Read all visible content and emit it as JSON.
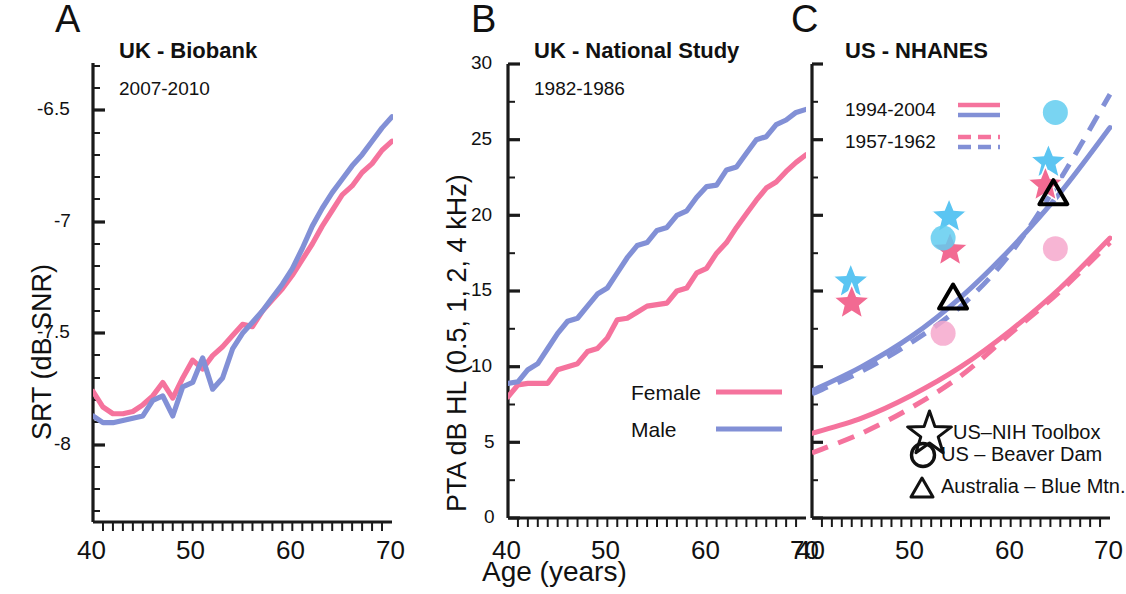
{
  "figure": {
    "xlabel": "Age (years)",
    "x_ticks": [
      "40",
      "50",
      "60",
      "70"
    ],
    "colors": {
      "female_pink": "#F5739D",
      "male_blue": "#8290D6",
      "marker_blue": "#5BC5F2",
      "marker_pink": "#F26A92",
      "circle_cyan": "#62CDF0",
      "circle_pink": "#F6A8CC",
      "axis_black": "#1a1a1a"
    }
  },
  "panelA": {
    "letter": "A",
    "title": "UK - Biobank",
    "subtitle": "2007-2010",
    "ylabel": "SRT (dB SNR)",
    "y_ticks": [
      "-6.5",
      "-7",
      "-7.5",
      "-8"
    ],
    "x_ticks": [
      "40",
      "50",
      "60",
      "70"
    ]
  },
  "panelB": {
    "letter": "B",
    "title": "UK - National Study",
    "subtitle": "1982-1986",
    "ylabel": "PTA dB HL (0.5, 1, 2, 4 kHz)",
    "y_ticks": [
      "30",
      "25",
      "20",
      "15",
      "10",
      "5",
      "0"
    ],
    "x_ticks": [
      "40",
      "50",
      "60",
      "70"
    ],
    "legend": [
      {
        "label": "Female",
        "style": "solid",
        "color": "#F5739D"
      },
      {
        "label": "Male",
        "style": "solid",
        "color": "#8290D6"
      }
    ]
  },
  "panelC": {
    "letter": "C",
    "title": "US - NHANES",
    "x_ticks": [
      "40",
      "50",
      "60",
      "70"
    ],
    "period_legend": [
      {
        "label": "1994-2004",
        "style": "solid"
      },
      {
        "label": "1957-1962",
        "style": "dashed"
      }
    ],
    "marker_legend": [
      {
        "symbol": "star",
        "label": "US–NIH Toolbox"
      },
      {
        "symbol": "circle",
        "label": "US – Beaver Dam"
      },
      {
        "symbol": "triangle",
        "label": "Australia – Blue Mtn."
      }
    ]
  },
  "chart_data": [
    {
      "type": "line",
      "panel": "A",
      "title": "UK - Biobank",
      "subtitle": "2007-2010",
      "xlabel": "Age (years)",
      "ylabel": "SRT (dB SNR)",
      "xlim": [
        40,
        70
      ],
      "ylim": [
        -8.2,
        -6.3
      ],
      "yticks": [
        -6.5,
        -7,
        -7.5,
        -8
      ],
      "xticks": [
        40,
        50,
        60,
        70
      ],
      "grid": false,
      "legend": "none",
      "x": [
        40,
        41,
        42,
        43,
        44,
        45,
        46,
        47,
        48,
        49,
        50,
        51,
        52,
        53,
        54,
        55,
        56,
        57,
        58,
        59,
        60,
        61,
        62,
        63,
        64,
        65,
        66,
        67,
        68,
        69,
        70
      ],
      "series": [
        {
          "name": "Female",
          "color": "#F5739D",
          "values": [
            -7.76,
            -7.83,
            -7.86,
            -7.86,
            -7.85,
            -7.82,
            -7.78,
            -7.72,
            -7.79,
            -7.7,
            -7.62,
            -7.66,
            -7.6,
            -7.56,
            -7.51,
            -7.46,
            -7.47,
            -7.4,
            -7.35,
            -7.3,
            -7.24,
            -7.17,
            -7.1,
            -7.02,
            -6.95,
            -6.88,
            -6.84,
            -6.78,
            -6.74,
            -6.68,
            -6.64
          ]
        },
        {
          "name": "Male",
          "color": "#8290D6",
          "values": [
            -7.87,
            -7.9,
            -7.9,
            -7.89,
            -7.88,
            -7.87,
            -7.8,
            -7.78,
            -7.87,
            -7.74,
            -7.72,
            -7.61,
            -7.75,
            -7.7,
            -7.57,
            -7.5,
            -7.45,
            -7.4,
            -7.34,
            -7.28,
            -7.21,
            -7.12,
            -7.02,
            -6.94,
            -6.87,
            -6.81,
            -6.75,
            -6.7,
            -6.64,
            -6.58,
            -6.53
          ]
        }
      ]
    },
    {
      "type": "line",
      "panel": "B",
      "title": "UK - National Study",
      "subtitle": "1982-1986",
      "xlabel": "Age (years)",
      "ylabel": "PTA dB HL (0.5, 1, 2, 4 kHz)",
      "xlim": [
        40,
        70
      ],
      "ylim": [
        0,
        30
      ],
      "yticks": [
        0,
        5,
        10,
        15,
        20,
        25,
        30
      ],
      "xticks": [
        40,
        50,
        60,
        70
      ],
      "grid": false,
      "legend": "bottom-right",
      "x": [
        40,
        41,
        42,
        43,
        44,
        45,
        46,
        47,
        48,
        49,
        50,
        51,
        52,
        53,
        54,
        55,
        56,
        57,
        58,
        59,
        60,
        61,
        62,
        63,
        64,
        65,
        66,
        67,
        68,
        69,
        70
      ],
      "series": [
        {
          "name": "Female",
          "color": "#F5739D",
          "values": [
            8.0,
            8.8,
            8.9,
            8.9,
            8.9,
            9.8,
            10.0,
            10.2,
            11.0,
            11.2,
            11.9,
            13.1,
            13.2,
            13.6,
            14.0,
            14.1,
            14.2,
            15.0,
            15.2,
            16.2,
            16.5,
            17.5,
            18.2,
            19.2,
            20.1,
            21.0,
            21.8,
            22.2,
            22.9,
            23.5,
            24.0
          ]
        },
        {
          "name": "Male",
          "color": "#8290D6",
          "values": [
            8.9,
            9.0,
            9.8,
            10.2,
            11.2,
            12.2,
            13.0,
            13.2,
            14.0,
            14.8,
            15.2,
            16.2,
            17.2,
            18.0,
            18.2,
            19.0,
            19.2,
            20.0,
            20.3,
            21.2,
            21.9,
            22.0,
            23.0,
            23.2,
            24.1,
            25.0,
            25.2,
            26.0,
            26.3,
            26.8,
            27.0
          ]
        }
      ]
    },
    {
      "type": "line",
      "panel": "C",
      "title": "US - NHANES",
      "xlabel": "Age (years)",
      "ylabel": "PTA dB HL (0.5, 1, 2, 4 kHz)",
      "xlim": [
        40,
        70
      ],
      "ylim": [
        0,
        30
      ],
      "yticks": [
        0,
        5,
        10,
        15,
        20,
        25,
        30
      ],
      "xticks": [
        40,
        50,
        60,
        70
      ],
      "grid": false,
      "legend": "inset",
      "series": [
        {
          "name": "Male 1994-2004",
          "color": "#8290D6",
          "style": "solid",
          "x": [
            40,
            45,
            50,
            55,
            60,
            65,
            70
          ],
          "values": [
            8.4,
            10.0,
            12.0,
            14.6,
            17.8,
            21.5,
            25.8
          ]
        },
        {
          "name": "Male 1957-1962",
          "color": "#8290D6",
          "style": "dashed",
          "x": [
            40,
            45,
            50,
            55,
            60,
            65,
            70
          ],
          "values": [
            8.2,
            9.7,
            11.6,
            14.0,
            17.5,
            22.4,
            28.0
          ]
        },
        {
          "name": "Female 1994-2004",
          "color": "#F5739D",
          "style": "solid",
          "x": [
            40,
            45,
            50,
            55,
            60,
            65,
            70
          ],
          "values": [
            5.6,
            6.6,
            8.1,
            10.0,
            12.4,
            15.2,
            18.5
          ]
        },
        {
          "name": "Female 1957-1962",
          "color": "#F5739D",
          "style": "dashed",
          "x": [
            40,
            45,
            50,
            55,
            60,
            65,
            70
          ],
          "values": [
            4.3,
            5.6,
            7.3,
            9.4,
            12.2,
            15.0,
            18.2
          ]
        }
      ],
      "markers": [
        {
          "symbol": "star",
          "color": "#5BC5F2",
          "x": 43.9,
          "y": 15.6,
          "group": "US–NIH Toolbox",
          "sex": "Male"
        },
        {
          "symbol": "star",
          "color": "#F26A92",
          "x": 44.0,
          "y": 14.2,
          "group": "US–NIH Toolbox",
          "sex": "Female"
        },
        {
          "symbol": "star",
          "color": "#5BC5F2",
          "x": 53.8,
          "y": 19.9,
          "group": "US–NIH Toolbox",
          "sex": "Male"
        },
        {
          "symbol": "star",
          "color": "#F26A92",
          "x": 53.9,
          "y": 17.7,
          "group": "US–NIH Toolbox",
          "sex": "Female"
        },
        {
          "symbol": "star",
          "color": "#5BC5F2",
          "x": 63.8,
          "y": 23.5,
          "group": "US–NIH Toolbox",
          "sex": "Male"
        },
        {
          "symbol": "star",
          "color": "#F26A92",
          "x": 63.5,
          "y": 22.0,
          "group": "US–NIH Toolbox",
          "sex": "Female"
        },
        {
          "symbol": "circle",
          "color": "#62CDF0",
          "x": 64.5,
          "y": 26.8,
          "group": "US – Beaver Dam",
          "sex": "Male"
        },
        {
          "symbol": "circle",
          "color": "#62CDF0",
          "x": 53.2,
          "y": 18.5,
          "group": "US – Beaver Dam",
          "sex": "Male"
        },
        {
          "symbol": "circle",
          "color": "#F6A8CC",
          "x": 64.5,
          "y": 17.8,
          "group": "US – Beaver Dam",
          "sex": "Female"
        },
        {
          "symbol": "circle",
          "color": "#F6A8CC",
          "x": 53.2,
          "y": 12.2,
          "group": "US – Beaver Dam",
          "sex": "Female"
        },
        {
          "symbol": "triangle",
          "color": "#000000",
          "x": 54.2,
          "y": 14.5,
          "group": "Australia – Blue Mtn."
        },
        {
          "symbol": "triangle",
          "color": "#000000",
          "x": 64.3,
          "y": 21.4,
          "group": "Australia – Blue Mtn."
        }
      ]
    }
  ]
}
